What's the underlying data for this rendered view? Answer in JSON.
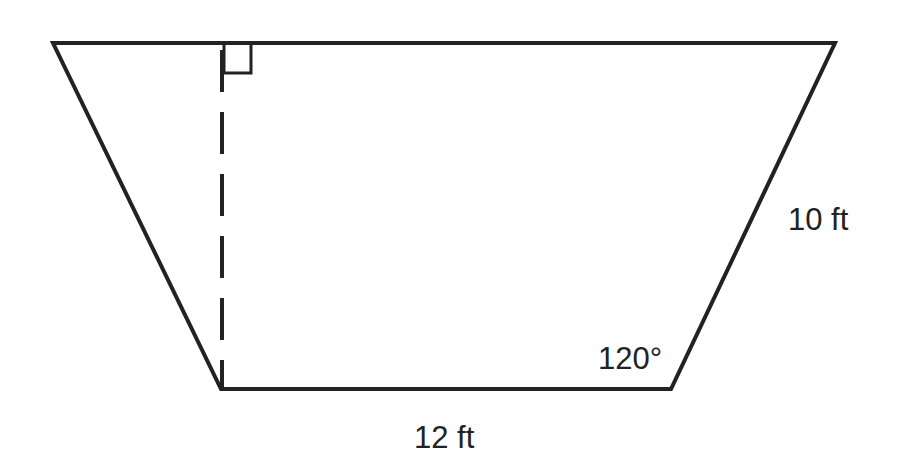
{
  "figure": {
    "type": "trapezoid",
    "labels": {
      "slant_side": "10 ft",
      "bottom_base": "12 ft",
      "angle": "120°"
    },
    "markers": {
      "right_angle": "right-angle-marker",
      "height_line": "dashed-altitude"
    },
    "colors": {
      "stroke": "#222222",
      "background": "#ffffff"
    }
  }
}
